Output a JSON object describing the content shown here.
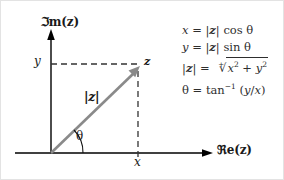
{
  "figure": {
    "type": "complex-plane-argand-diagram",
    "background_color": "#ffffff",
    "axis_color": "#000000",
    "vector_color": "#8a8a8a",
    "dash_color": "#333333",
    "text_color": "#1a1a1a",
    "equation_color": "#2e2e2e"
  },
  "axes": {
    "imaginary_label": "ℑm(z)",
    "real_label": "ℜe(z)",
    "origin": {
      "x": 50,
      "y": 152
    },
    "vertical_top": {
      "x": 50,
      "y": 32
    },
    "horizontal_right": {
      "x": 210,
      "y": 152
    }
  },
  "ticks": {
    "y_label": "y",
    "x_label": "x"
  },
  "vector": {
    "point_label": "z",
    "magnitude_label": "|z|",
    "angle_label": "θ",
    "tip": {
      "x": 137,
      "y": 68
    }
  },
  "equations": [
    {
      "id": "x-equation",
      "text": "x = |z| cos θ"
    },
    {
      "id": "y-equation",
      "text": "y = |z| sin θ"
    },
    {
      "id": "modulus-equation",
      "text": "|z| = ⁺√(x² + y²)"
    },
    {
      "id": "theta-equation",
      "text": "θ = tan⁻¹ (y/x)"
    }
  ]
}
